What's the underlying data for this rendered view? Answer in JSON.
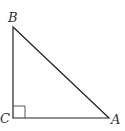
{
  "diagram": {
    "type": "right-triangle",
    "vertices": {
      "B": {
        "label": "B",
        "x": 13,
        "y": 27
      },
      "C": {
        "label": "C",
        "x": 13,
        "y": 118
      },
      "A": {
        "label": "A",
        "x": 109,
        "y": 118
      }
    },
    "right_angle_at": "C",
    "right_angle_marker_size": 12,
    "stroke_color": "#222222",
    "label_color": "#333333"
  }
}
